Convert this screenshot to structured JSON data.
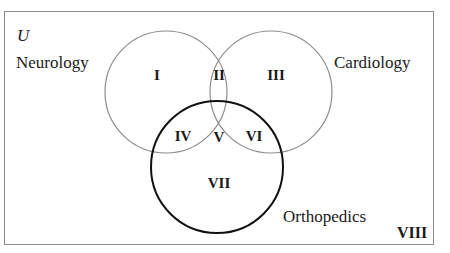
{
  "figure": {
    "type": "venn-diagram-3-set",
    "universe_symbol": "U",
    "background_color": "#ffffff",
    "border_color": "#8a8a8a"
  },
  "sets": [
    {
      "id": "neurology",
      "label": "Neurology",
      "stroke_color": "#8c8c8c",
      "stroke_width": 1
    },
    {
      "id": "cardiology",
      "label": "Cardiology",
      "stroke_color": "#8c8c8c",
      "stroke_width": 1
    },
    {
      "id": "orthopedics",
      "label": "Orthopedics",
      "stroke_color": "#111111",
      "stroke_width": 2
    }
  ],
  "regions": [
    {
      "id": "I",
      "label": "I",
      "meaning": "neurology-only"
    },
    {
      "id": "II",
      "label": "II",
      "meaning": "neurology-and-cardiology"
    },
    {
      "id": "III",
      "label": "III",
      "meaning": "cardiology-only"
    },
    {
      "id": "IV",
      "label": "IV",
      "meaning": "neurology-and-orthopedics"
    },
    {
      "id": "V",
      "label": "V",
      "meaning": "all-three"
    },
    {
      "id": "VI",
      "label": "VI",
      "meaning": "cardiology-and-orthopedics"
    },
    {
      "id": "VII",
      "label": "VII",
      "meaning": "orthopedics-only"
    },
    {
      "id": "VIII",
      "label": "VIII",
      "meaning": "outside-all-sets"
    }
  ]
}
